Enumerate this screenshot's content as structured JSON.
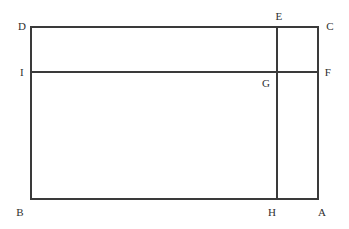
{
  "figure": {
    "canvas": {
      "width": 349,
      "height": 229,
      "background": "#ffffff"
    },
    "stroke": {
      "color": "#3a3a3a",
      "width": 1.1
    },
    "label_color": "#2f2f2f",
    "label_font_size": 11,
    "points": [
      {
        "id": "A",
        "label": "A",
        "x": 318,
        "y": 199,
        "label_x": 322,
        "label_y": 212
      },
      {
        "id": "B",
        "label": "B",
        "x": 31,
        "y": 199,
        "label_x": 20,
        "label_y": 212
      },
      {
        "id": "C",
        "label": "C",
        "x": 318,
        "y": 27,
        "label_x": 330,
        "label_y": 26
      },
      {
        "id": "D",
        "label": "D",
        "x": 31,
        "y": 27,
        "label_x": 22,
        "label_y": 26
      },
      {
        "id": "E",
        "label": "E",
        "x": 277,
        "y": 27,
        "label_x": 279,
        "label_y": 16
      },
      {
        "id": "F",
        "label": "F",
        "x": 318,
        "y": 72,
        "label_x": 328,
        "label_y": 72
      },
      {
        "id": "G",
        "label": "G",
        "x": 277,
        "y": 72,
        "label_x": 266,
        "label_y": 83
      },
      {
        "id": "H",
        "label": "H",
        "x": 277,
        "y": 199,
        "label_x": 272,
        "label_y": 212
      },
      {
        "id": "I",
        "label": "I",
        "x": 31,
        "y": 72,
        "label_x": 22,
        "label_y": 72
      }
    ],
    "segments": [
      {
        "id": "DC",
        "name": "top-edge",
        "x1": 31,
        "y1": 27,
        "x2": 318,
        "y2": 27
      },
      {
        "id": "BA",
        "name": "bottom-edge",
        "x1": 31,
        "y1": 199,
        "x2": 318,
        "y2": 199
      },
      {
        "id": "DB",
        "name": "left-edge",
        "x1": 31,
        "y1": 27,
        "x2": 31,
        "y2": 199
      },
      {
        "id": "CA",
        "name": "right-edge",
        "x1": 318,
        "y1": 27,
        "x2": 318,
        "y2": 199
      },
      {
        "id": "IF",
        "name": "horizontal-chord",
        "x1": 31,
        "y1": 72,
        "x2": 318,
        "y2": 72
      },
      {
        "id": "EH",
        "name": "vertical-chord",
        "x1": 277,
        "y1": 27,
        "x2": 277,
        "y2": 199
      }
    ]
  }
}
